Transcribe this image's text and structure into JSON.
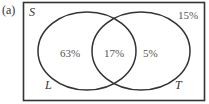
{
  "figure": {
    "panel_label": "(a)",
    "universe_label": "S",
    "sets": [
      {
        "name": "L",
        "only_value": "63%"
      },
      {
        "name": "T",
        "only_value": "5%"
      }
    ],
    "intersection_value": "17%",
    "outside_value": "15%"
  },
  "colors": {
    "stroke": "#333333",
    "text": "#555555",
    "background": "#ffffff"
  }
}
